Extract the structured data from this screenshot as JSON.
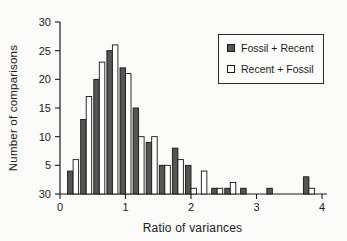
{
  "figure": {
    "background": "#fbfbfa",
    "axis_color": "#1c1c1c",
    "text_color": "#222222"
  },
  "chart_data": {
    "type": "bar",
    "title": "",
    "xlabel": "Ratio of variances",
    "ylabel": "Number of comparisons",
    "grid": false,
    "legend_position": "top-right",
    "xlim": [
      0,
      4
    ],
    "ylim": [
      0,
      30
    ],
    "x_ticks": [
      {
        "value": 0,
        "label": "0"
      },
      {
        "value": 1,
        "label": "1"
      },
      {
        "value": 2,
        "label": "2"
      },
      {
        "value": 3,
        "label": "3"
      },
      {
        "value": 4,
        "label": "4"
      }
    ],
    "y_ticks": [
      {
        "value": 30,
        "label": "30"
      },
      {
        "value": 25,
        "label": "25"
      },
      {
        "value": 20,
        "label": "20"
      },
      {
        "value": 15,
        "label": "15"
      },
      {
        "value": 10,
        "label": "10"
      },
      {
        "value": 5,
        "label": "5"
      },
      {
        "value": 0,
        "label": "30"
      }
    ],
    "bin_centers": [
      0.2,
      0.4,
      0.6,
      0.8,
      1.0,
      1.2,
      1.4,
      1.6,
      1.8,
      2.0,
      2.2,
      2.4,
      2.6,
      2.8,
      3.2,
      3.8
    ],
    "series": [
      {
        "name": "Fossil + Recent",
        "swatch": "filled",
        "color": "#555553",
        "values": [
          4,
          13,
          20,
          25,
          22,
          15,
          9,
          5,
          8,
          5,
          null,
          1,
          1,
          1,
          1,
          3
        ]
      },
      {
        "name": "Recent + Fossil",
        "swatch": "open",
        "color": "#fdfdfc",
        "values": [
          6,
          17,
          23,
          26,
          21,
          10,
          10,
          5,
          6,
          1,
          4,
          1,
          2,
          null,
          null,
          1
        ]
      }
    ]
  }
}
